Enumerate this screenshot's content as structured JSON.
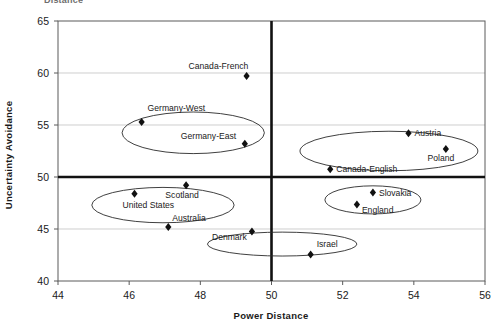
{
  "figure": {
    "cut_off_title": "Distance",
    "xlabel": "Power Distance",
    "ylabel": "Uncertainty Avoidance"
  },
  "chart_data": {
    "type": "scatter",
    "title": "",
    "xlabel": "Power Distance",
    "ylabel": "Uncertainty Avoidance",
    "xlim": [
      44,
      56
    ],
    "ylim": [
      40,
      65
    ],
    "xticks": [
      44,
      46,
      48,
      50,
      52,
      54,
      56
    ],
    "yticks": [
      40,
      45,
      50,
      55,
      60,
      65
    ],
    "grid": true,
    "grid_axis": "y",
    "legend": "none",
    "reference_lines": [
      {
        "axis": "y",
        "value": 50,
        "style": "thick-black"
      },
      {
        "axis": "x",
        "value": 50,
        "style": "thick-black"
      }
    ],
    "marker": "diamond",
    "points": [
      {
        "label": "Canada-French",
        "x": 49.3,
        "y": 59.7,
        "label_dx": -58,
        "label_dy": -7
      },
      {
        "label": "Germany-West",
        "x": 46.35,
        "y": 55.3,
        "label_dx": 6,
        "label_dy": -11
      },
      {
        "label": "Germany-East",
        "x": 49.25,
        "y": 53.2,
        "label_dx": -64,
        "label_dy": -5
      },
      {
        "label": "Austria",
        "x": 53.85,
        "y": 54.2,
        "label_dx": 6,
        "label_dy": 3
      },
      {
        "label": "Poland",
        "x": 54.9,
        "y": 52.7,
        "label_dx": -5,
        "label_dy": 12
      },
      {
        "label": "Canada-English",
        "x": 51.65,
        "y": 50.75,
        "label_dx": 6,
        "label_dy": 3
      },
      {
        "label": "Scotland",
        "x": 47.6,
        "y": 49.2,
        "label_dx": -4,
        "label_dy": 13
      },
      {
        "label": "United States",
        "x": 46.15,
        "y": 48.4,
        "label_dx": -12,
        "label_dy": 14
      },
      {
        "label": "Australia",
        "x": 47.1,
        "y": 45.2,
        "label_dx": 4,
        "label_dy": -6
      },
      {
        "label": "Slovakia",
        "x": 52.85,
        "y": 48.5,
        "label_dx": 6,
        "label_dy": 3
      },
      {
        "label": "England",
        "x": 52.4,
        "y": 47.35,
        "label_dx": 5,
        "label_dy": 8
      },
      {
        "label": "Denmark",
        "x": 49.45,
        "y": 44.75,
        "label_dx": -40,
        "label_dy": 8
      },
      {
        "label": "Israel",
        "x": 51.1,
        "y": 42.55,
        "label_dx": 6,
        "label_dy": -7
      }
    ],
    "clusters": [
      {
        "name": "germany-cluster",
        "cx": 47.8,
        "cy": 54.25,
        "rx": 2.0,
        "ry": 2.0
      },
      {
        "name": "austria-poland-cluster",
        "cx": 53.3,
        "cy": 52.5,
        "rx": 2.5,
        "ry": 1.9
      },
      {
        "name": "anglo-cluster",
        "cx": 46.95,
        "cy": 47.3,
        "rx": 2.0,
        "ry": 1.7
      },
      {
        "name": "slovakia-england-cluster",
        "cx": 52.85,
        "cy": 47.8,
        "rx": 1.35,
        "ry": 1.35
      },
      {
        "name": "denmark-israel-cluster",
        "cx": 50.3,
        "cy": 43.55,
        "rx": 2.1,
        "ry": 1.15
      }
    ]
  }
}
